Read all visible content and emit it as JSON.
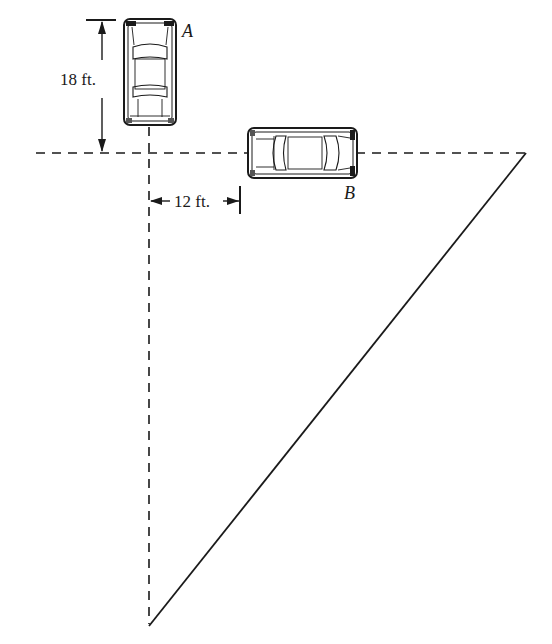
{
  "diagram": {
    "type": "related-rates geometry figure",
    "colors": {
      "ink": "#1a1a1a",
      "background": "#ffffff",
      "car_fill": "#ffffff"
    },
    "cars": [
      {
        "id": "A",
        "label": "A",
        "orientation": "vertical",
        "heading": "down toward intersection"
      },
      {
        "id": "B",
        "label": "B",
        "orientation": "horizontal",
        "heading": "right along road"
      }
    ],
    "dimensions": {
      "car_a_distance": {
        "label": "18 ft.",
        "value": 18,
        "unit": "ft"
      },
      "car_b_distance": {
        "label": "12 ft.",
        "value": 12,
        "unit": "ft"
      }
    },
    "lines": {
      "horizontal_road": "dashed",
      "vertical_road": "dashed",
      "hypotenuse": "solid"
    }
  }
}
